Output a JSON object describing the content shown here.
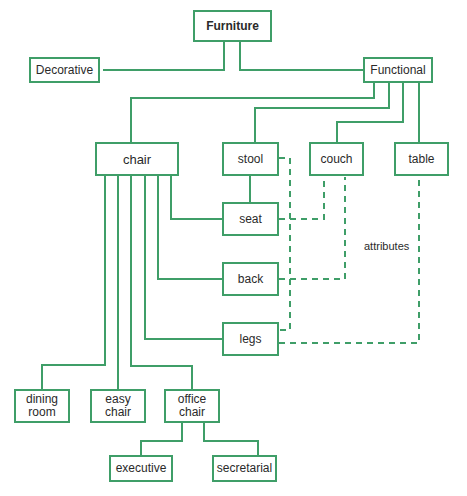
{
  "diagram": {
    "root": "Furniture",
    "level1": {
      "decorative": "Decorative",
      "functional": "Functional"
    },
    "functional_children": {
      "chair": "chair",
      "stool": "stool",
      "couch": "couch",
      "table": "table"
    },
    "parts": {
      "seat": "seat",
      "back": "back",
      "legs": "legs"
    },
    "chair_types": {
      "dining_room_line1": "dining",
      "dining_room_line2": "room",
      "easy_chair_line1": "easy",
      "easy_chair_line2": "chair",
      "office_chair_line1": "office",
      "office_chair_line2": "chair"
    },
    "office_types": {
      "executive": "executive",
      "secretarial": "secretarial"
    },
    "annotation": "attributes",
    "colors": {
      "line": "#3f9e68",
      "text": "#2a2a2a"
    }
  }
}
